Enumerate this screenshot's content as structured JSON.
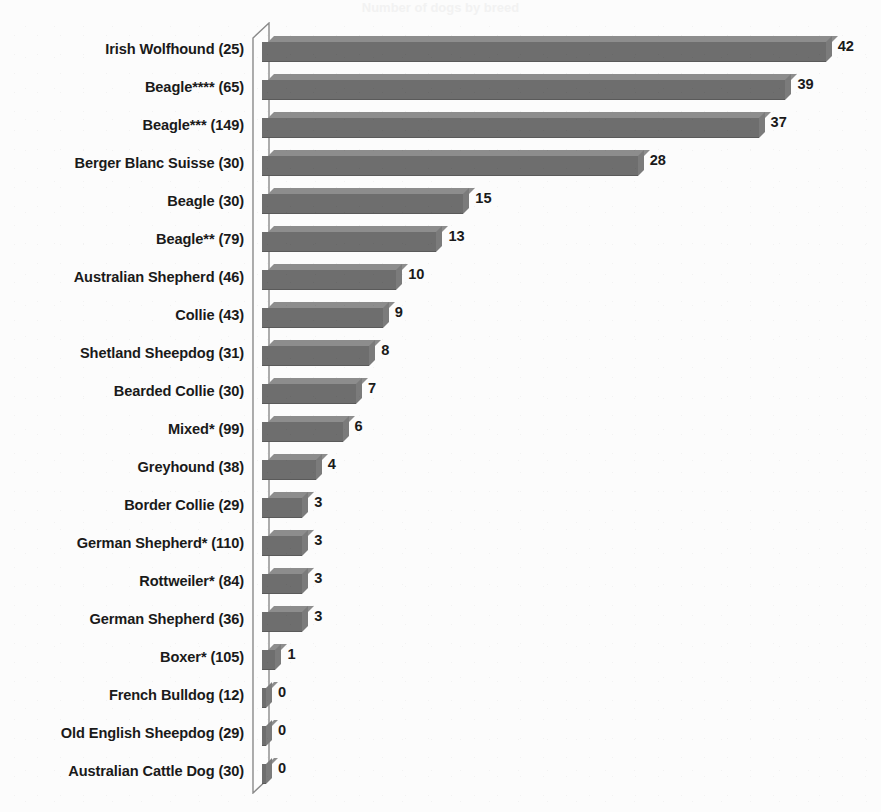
{
  "title_faint": "Number of dogs by breed",
  "chart_data": {
    "type": "bar",
    "orientation": "horizontal",
    "title": "Number of dogs by breed",
    "xlabel": "",
    "ylabel": "",
    "xlim": [
      0,
      42
    ],
    "grid": false,
    "legend": null,
    "bar_color": "#6e6e6e",
    "bar_top_color": "#8d8d8d",
    "bar_side_color": "#7b7b7b",
    "axis_color": "#8a8a8a",
    "background_color": "#fcfcfc",
    "label_color": "#1a1a1a",
    "categories": [
      "Irish Wolfhound (25)",
      "Beagle**** (65)",
      "Beagle*** (149)",
      "Berger Blanc Suisse (30)",
      "Beagle (30)",
      "Beagle** (79)",
      "Australian Shepherd (46)",
      "Collie (43)",
      "Shetland Sheepdog (31)",
      "Bearded Collie (30)",
      "Mixed* (99)",
      "Greyhound (38)",
      "Border Collie (29)",
      "German Shepherd* (110)",
      "Rottweiler* (84)",
      "German Shepherd (36)",
      "Boxer* (105)",
      "French Bulldog (12)",
      "Old English Sheepdog (29)",
      "Australian Cattle Dog (30)"
    ],
    "values": [
      42,
      39,
      37,
      28,
      15,
      13,
      10,
      9,
      8,
      7,
      6,
      4,
      3,
      3,
      3,
      3,
      1,
      0,
      0,
      0
    ],
    "value_labels": [
      "42",
      "39",
      "37",
      "28",
      "15",
      "13",
      "10",
      "9",
      "8",
      "7",
      "6",
      "4",
      "3",
      "3",
      "3",
      "3",
      "1",
      "0",
      "0",
      "0"
    ]
  }
}
